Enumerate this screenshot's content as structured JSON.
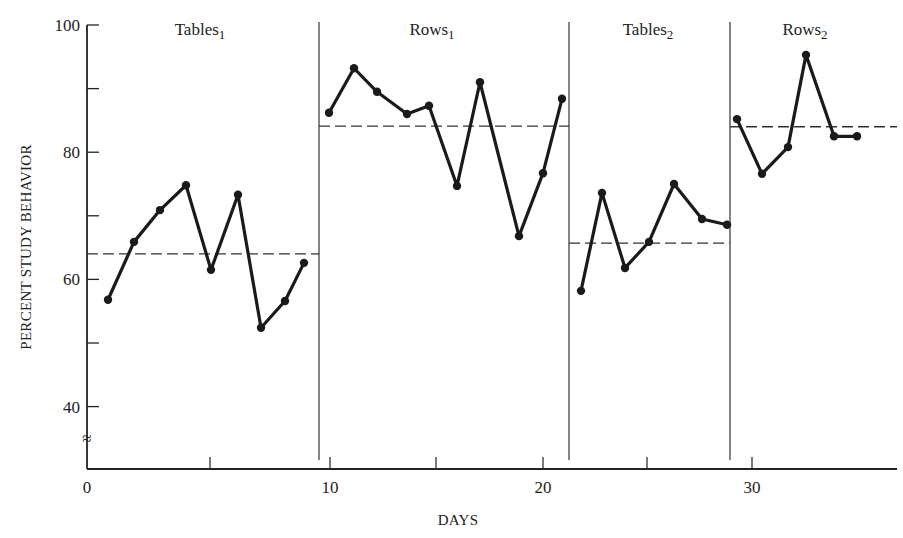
{
  "chart_data": {
    "type": "line",
    "title": "",
    "xlabel": "DAYS",
    "ylabel": "PERCENT STUDY BEHAVIOR",
    "xlim": [
      0,
      33
    ],
    "ylim": [
      30,
      100
    ],
    "y_axis_break": true,
    "y_ticks": [
      40,
      50,
      60,
      70,
      80,
      90,
      100
    ],
    "y_tick_labels": [
      "40",
      "",
      "60",
      "",
      "80",
      "",
      "100"
    ],
    "x_ticks": [
      0,
      5,
      10,
      15,
      20,
      25,
      30
    ],
    "x_tick_labels": [
      "0",
      "",
      "10",
      "",
      "20",
      "",
      "30"
    ],
    "grid": false,
    "legend": null,
    "phases": [
      {
        "name": "Tables1",
        "label": "Tables",
        "subscript": "1",
        "days": [
          1,
          2,
          3,
          4,
          5,
          6,
          7,
          8,
          9
        ],
        "values": [
          56.8,
          65.9,
          70.9,
          74.8,
          61.5,
          73.3,
          52.4,
          56.6,
          62.6
        ],
        "mean": 64.0
      },
      {
        "name": "Rows1",
        "label": "Rows",
        "subscript": "1",
        "days": [
          10,
          11,
          12,
          13,
          14,
          15,
          16,
          17,
          18,
          19
        ],
        "values": [
          86.2,
          93.2,
          89.5,
          86.0,
          87.3,
          74.7,
          91.0,
          66.8,
          76.7,
          88.4
        ],
        "mean": 84.1
      },
      {
        "name": "Tables2",
        "label": "Tables",
        "subscript": "2",
        "days": [
          20,
          21,
          22,
          23,
          24,
          25,
          26
        ],
        "values": [
          58.2,
          73.6,
          61.8,
          65.9,
          75.0,
          69.5,
          68.6
        ],
        "mean": 65.7
      },
      {
        "name": "Rows2",
        "label": "Rows",
        "subscript": "2",
        "days": [
          27,
          28,
          29,
          30,
          31,
          32
        ],
        "values": [
          85.2,
          76.6,
          80.8,
          95.3,
          82.5,
          82.5
        ],
        "mean": 84.0
      }
    ],
    "phase_dividers_after_day": [
      9.5,
      19.5,
      26.5
    ],
    "annotations": [
      "Dashed horizontal lines indicate phase means"
    ]
  },
  "render": {
    "x_pixels": [
      108,
      134,
      160,
      186,
      211,
      238,
      261,
      285,
      304,
      329,
      354,
      377,
      407,
      429,
      457,
      480,
      519,
      543,
      562,
      581,
      602,
      625,
      649,
      674,
      702,
      727,
      737,
      762,
      788,
      806,
      834,
      857
    ],
    "divider_x": [
      319,
      569,
      730
    ],
    "phase_ranges": [
      [
        87,
        319
      ],
      [
        319,
        569
      ],
      [
        569,
        730
      ],
      [
        730,
        897
      ]
    ],
    "phase_label_x": [
      200,
      432,
      648,
      805
    ],
    "x_tick_px": [
      87,
      210,
      330,
      436,
      543,
      647,
      752
    ]
  }
}
